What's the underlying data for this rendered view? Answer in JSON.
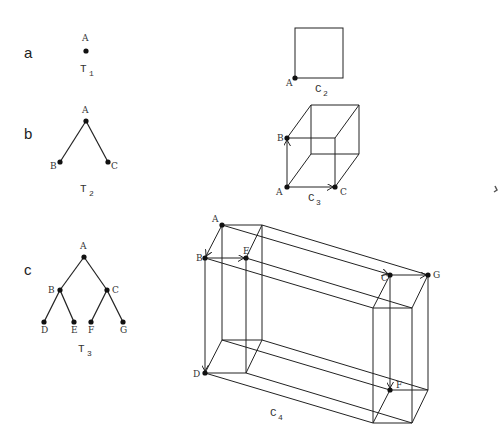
{
  "figure": {
    "rows": [
      {
        "label": "a"
      },
      {
        "label": "b"
      },
      {
        "label": "c"
      }
    ],
    "trees": [
      {
        "name": "T",
        "sub": "1",
        "nodes": [
          "A"
        ]
      },
      {
        "name": "T",
        "sub": "2",
        "nodes": [
          "A",
          "B",
          "C"
        ]
      },
      {
        "name": "T",
        "sub": "3",
        "nodes": [
          "A",
          "B",
          "C",
          "D",
          "E",
          "F",
          "G"
        ]
      }
    ],
    "cubes": [
      {
        "name": "C",
        "sub": "2",
        "nodes": [
          "A"
        ]
      },
      {
        "name": "C",
        "sub": "3",
        "nodes": [
          "A",
          "B",
          "C"
        ]
      },
      {
        "name": "C",
        "sub": "4",
        "nodes": [
          "A",
          "B",
          "E",
          "C",
          "G",
          "D",
          "F"
        ]
      }
    ]
  }
}
